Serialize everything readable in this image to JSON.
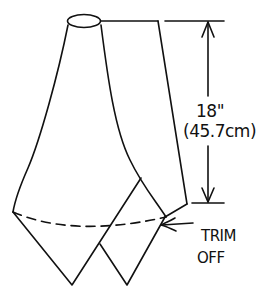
{
  "diagram": {
    "stroke_color": "#111111",
    "background_color": "#ffffff",
    "dimension": {
      "imperial": "18\"",
      "metric": "(45.7cm)"
    },
    "annotation": {
      "line1": "TRIM",
      "line2": "OFF"
    }
  }
}
